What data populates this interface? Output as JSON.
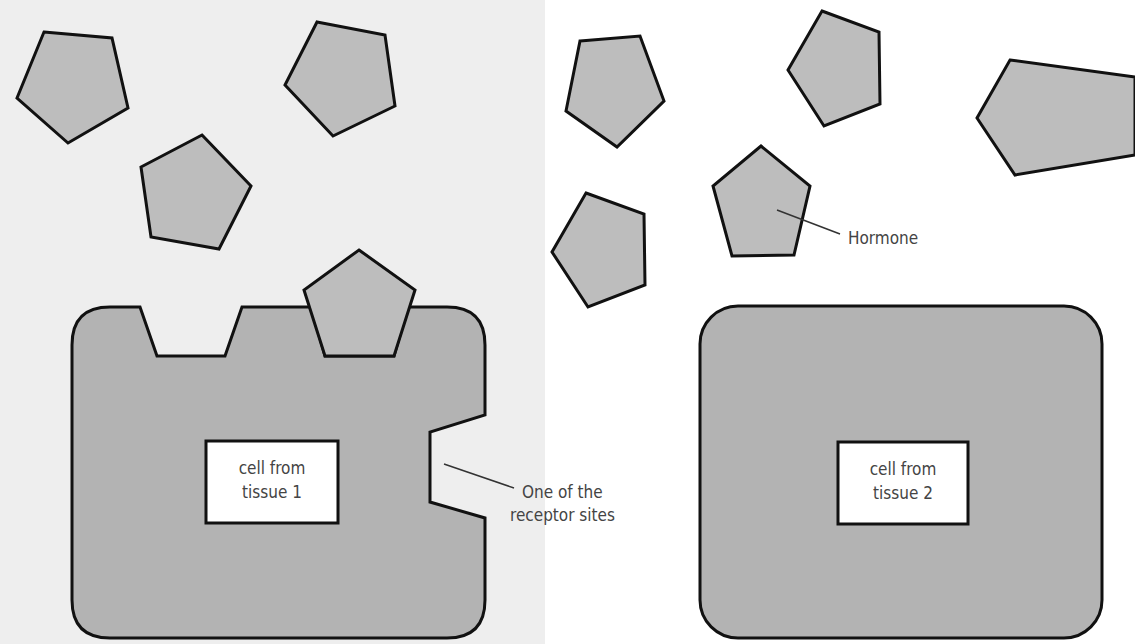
{
  "diagram": {
    "type": "hormone-receptor illustration",
    "hormone_count_total": 10,
    "left_panel": {
      "cell_label_line1": "cell from",
      "cell_label_line2": "tissue 1",
      "receptor_label_line1": "One of the",
      "receptor_label_line2": "receptor sites",
      "receptor_sites": 3,
      "bound_hormones": 1
    },
    "right_panel": {
      "cell_label_line1": "cell from",
      "cell_label_line2": "tissue 2",
      "hormone_label": "Hormone",
      "receptor_sites": 0
    },
    "colors": {
      "hormone_fill": "#bdbdbd",
      "cell_fill": "#b3b3b3",
      "outline": "#111111",
      "nucleus_fill": "#ffffff",
      "label_text": "#444444"
    }
  }
}
